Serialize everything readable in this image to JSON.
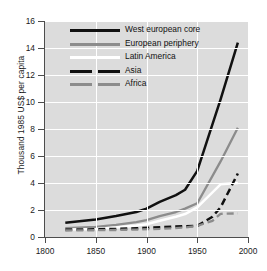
{
  "chart_data": {
    "type": "line",
    "title": "",
    "xlabel": "",
    "ylabel": "Thousand 1985 US$ per capita",
    "xlim": [
      1800,
      2000
    ],
    "ylim": [
      0,
      16
    ],
    "xticks": [
      1800,
      1850,
      1900,
      1950,
      2000
    ],
    "yticks": [
      0,
      2,
      4,
      6,
      8,
      10,
      12,
      14,
      16
    ],
    "grid": true,
    "legend_position": "upper center",
    "series": [
      {
        "name": "West european core",
        "color": "#111111",
        "style": "solid",
        "x": [
          1820,
          1850,
          1870,
          1890,
          1900,
          1913,
          1929,
          1938,
          1950,
          1973,
          1990
        ],
        "y": [
          1.05,
          1.3,
          1.55,
          1.85,
          2.1,
          2.6,
          3.1,
          3.5,
          4.9,
          10.2,
          14.4
        ]
      },
      {
        "name": "European periphery",
        "color": "#8c8c8c",
        "style": "solid",
        "x": [
          1820,
          1850,
          1870,
          1890,
          1900,
          1913,
          1929,
          1938,
          1950,
          1973,
          1990
        ],
        "y": [
          0.65,
          0.75,
          0.9,
          1.1,
          1.25,
          1.55,
          1.85,
          2.1,
          2.5,
          5.6,
          8.1
        ]
      },
      {
        "name": "Latin America",
        "color": "#ffffff",
        "style": "solid",
        "x": [
          1820,
          1850,
          1870,
          1890,
          1900,
          1913,
          1929,
          1938,
          1950,
          1973,
          1990
        ],
        "y": [
          0.55,
          0.6,
          0.7,
          0.85,
          0.95,
          1.2,
          1.5,
          1.7,
          2.2,
          3.9,
          4.0
        ]
      },
      {
        "name": "Asia",
        "color": "#111111",
        "style": "dashed",
        "x": [
          1820,
          1850,
          1870,
          1890,
          1913,
          1938,
          1950,
          1965,
          1973,
          1990
        ],
        "y": [
          0.55,
          0.57,
          0.6,
          0.65,
          0.72,
          0.8,
          0.82,
          1.5,
          2.2,
          4.7
        ]
      },
      {
        "name": "Africa",
        "color": "#8c8c8c",
        "style": "dashed",
        "x": [
          1820,
          1850,
          1870,
          1890,
          1913,
          1938,
          1950,
          1965,
          1973,
          1990
        ],
        "y": [
          0.48,
          0.5,
          0.52,
          0.55,
          0.6,
          0.7,
          0.82,
          1.2,
          1.72,
          1.75
        ]
      }
    ]
  },
  "legend": {
    "items": [
      {
        "label": "West european core",
        "key": "solid-black"
      },
      {
        "label": "European periphery",
        "key": "solid-gray"
      },
      {
        "label": "Latin America",
        "key": "solid-white"
      },
      {
        "label": "Asia",
        "key": "dash-black"
      },
      {
        "label": "Africa",
        "key": "dash-gray"
      }
    ]
  },
  "axis": {
    "y_title": "Thousand 1985 US$ per capita",
    "y_labels": [
      "0",
      "2",
      "4",
      "6",
      "8",
      "10",
      "12",
      "14",
      "16"
    ],
    "x_labels": [
      "1800",
      "1850",
      "1900",
      "1950",
      "2000"
    ]
  }
}
